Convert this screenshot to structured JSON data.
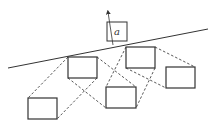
{
  "diagram": {
    "label_a": "a",
    "colors": {
      "stroke": "#333333",
      "dashed": "#444444",
      "background": "#ffffff"
    },
    "incline_line": {
      "x1": 8,
      "y1": 68,
      "x2": 208,
      "y2": 29
    },
    "arrow": {
      "x1": 113,
      "y1": 45,
      "x2": 108,
      "y2": 12
    },
    "box_a": {
      "x": 107,
      "y": 22,
      "w": 20,
      "h": 19
    },
    "boxes": [
      {
        "id": "A",
        "x": 68,
        "y": 57,
        "w": 29,
        "h": 21
      },
      {
        "id": "B",
        "x": 28,
        "y": 98,
        "w": 29,
        "h": 21
      },
      {
        "id": "C",
        "x": 126,
        "y": 47,
        "w": 29,
        "h": 21
      },
      {
        "id": "D",
        "x": 106,
        "y": 87,
        "w": 30,
        "h": 21
      },
      {
        "id": "E",
        "x": 166,
        "y": 67,
        "w": 29,
        "h": 21
      }
    ],
    "dashed_links": [
      {
        "x1": 68,
        "y1": 57,
        "x2": 28,
        "y2": 98
      },
      {
        "x1": 97,
        "y1": 78,
        "x2": 57,
        "y2": 119
      },
      {
        "x1": 68,
        "y1": 78,
        "x2": 106,
        "y2": 108
      },
      {
        "x1": 97,
        "y1": 57,
        "x2": 136,
        "y2": 87
      },
      {
        "x1": 126,
        "y1": 47,
        "x2": 106,
        "y2": 87
      },
      {
        "x1": 155,
        "y1": 68,
        "x2": 136,
        "y2": 108
      },
      {
        "x1": 126,
        "y1": 68,
        "x2": 166,
        "y2": 88
      },
      {
        "x1": 155,
        "y1": 47,
        "x2": 195,
        "y2": 67
      }
    ]
  }
}
